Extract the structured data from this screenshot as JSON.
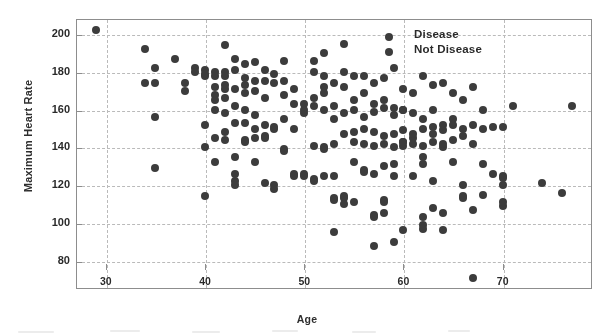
{
  "chart_data": {
    "type": "scatter",
    "title": "",
    "xlabel": "Age",
    "ylabel": "Maximum Heart Rate",
    "xlim": [
      27,
      79
    ],
    "ylim": [
      65,
      208
    ],
    "xticks": [
      30,
      40,
      50,
      60,
      70
    ],
    "yticks": [
      80,
      100,
      120,
      140,
      160,
      180,
      200
    ],
    "grid": true,
    "legend_position": "top-right",
    "marker_color": "#3d3d3d",
    "series": [
      {
        "name": "Disease",
        "color": "#3d3d3d",
        "points": [
          [
            29,
            202
          ],
          [
            34,
            192
          ],
          [
            35,
            182
          ],
          [
            34,
            174
          ],
          [
            35,
            174
          ],
          [
            37,
            187
          ],
          [
            38,
            174
          ],
          [
            38,
            170
          ],
          [
            39,
            182
          ],
          [
            39,
            180
          ],
          [
            40,
            181
          ],
          [
            40,
            179
          ],
          [
            40,
            178
          ],
          [
            41,
            180
          ],
          [
            41,
            178
          ],
          [
            41,
            172
          ],
          [
            41,
            168
          ],
          [
            41,
            165
          ],
          [
            42,
            194
          ],
          [
            42,
            180
          ],
          [
            42,
            178
          ],
          [
            42,
            173
          ],
          [
            42,
            171
          ],
          [
            42,
            166
          ],
          [
            43,
            187
          ],
          [
            43,
            181
          ],
          [
            43,
            171
          ],
          [
            43,
            162
          ],
          [
            44,
            184
          ],
          [
            44,
            177
          ],
          [
            44,
            173
          ],
          [
            44,
            169
          ],
          [
            44,
            153
          ],
          [
            45,
            185
          ],
          [
            45,
            175
          ],
          [
            45,
            170
          ],
          [
            46,
            181
          ],
          [
            46,
            175
          ],
          [
            46,
            166
          ],
          [
            47,
            179
          ],
          [
            47,
            174
          ],
          [
            48,
            186
          ],
          [
            48,
            175
          ],
          [
            48,
            168
          ],
          [
            49,
            171
          ],
          [
            49,
            163
          ],
          [
            50,
            163
          ],
          [
            50,
            158
          ],
          [
            51,
            186
          ],
          [
            51,
            180
          ],
          [
            51,
            166
          ],
          [
            52,
            190
          ],
          [
            52,
            178
          ],
          [
            52,
            172
          ],
          [
            52,
            169
          ],
          [
            53,
            174
          ],
          [
            53,
            162
          ],
          [
            54,
            195
          ],
          [
            54,
            180
          ],
          [
            54,
            172
          ],
          [
            55,
            178
          ],
          [
            55,
            165
          ],
          [
            56,
            178
          ],
          [
            56,
            169
          ],
          [
            57,
            174
          ],
          [
            57,
            163
          ],
          [
            58,
            177
          ],
          [
            58,
            165
          ],
          [
            59,
            182
          ],
          [
            59,
            161
          ],
          [
            60,
            171
          ],
          [
            60,
            160
          ],
          [
            61,
            169
          ],
          [
            62,
            178
          ],
          [
            63,
            173
          ],
          [
            64,
            174
          ],
          [
            65,
            169
          ],
          [
            66,
            165
          ],
          [
            67,
            172
          ],
          [
            68,
            160
          ],
          [
            71,
            162
          ],
          [
            77,
            162
          ],
          [
            35,
            156
          ],
          [
            40,
            152
          ],
          [
            41,
            160
          ],
          [
            42,
            158
          ],
          [
            43,
            153
          ],
          [
            44,
            160
          ],
          [
            45,
            157
          ],
          [
            46,
            152
          ],
          [
            47,
            150
          ],
          [
            48,
            155
          ],
          [
            49,
            150
          ],
          [
            50,
            160
          ],
          [
            51,
            162
          ],
          [
            52,
            160
          ],
          [
            53,
            155
          ],
          [
            54,
            158
          ],
          [
            55,
            160
          ],
          [
            56,
            156
          ],
          [
            57,
            159
          ],
          [
            58,
            161
          ],
          [
            59,
            157
          ],
          [
            60,
            160
          ],
          [
            61,
            158
          ],
          [
            62,
            155
          ],
          [
            63,
            160
          ],
          [
            64,
            152
          ],
          [
            65,
            155
          ],
          [
            66,
            150
          ],
          [
            67,
            152
          ],
          [
            68,
            150
          ],
          [
            69,
            151
          ],
          [
            70,
            151
          ]
        ]
      },
      {
        "name": "Not Disease",
        "color": "#3d3d3d",
        "points": [
          [
            35,
            129
          ],
          [
            40,
            114
          ],
          [
            40,
            140
          ],
          [
            41,
            145
          ],
          [
            41,
            132
          ],
          [
            42,
            148
          ],
          [
            42,
            144
          ],
          [
            43,
            135
          ],
          [
            43,
            126
          ],
          [
            43,
            122
          ],
          [
            43,
            120
          ],
          [
            44,
            144
          ],
          [
            44,
            143
          ],
          [
            45,
            150
          ],
          [
            45,
            145
          ],
          [
            45,
            132
          ],
          [
            46,
            146
          ],
          [
            46,
            145
          ],
          [
            46,
            121
          ],
          [
            47,
            120
          ],
          [
            47,
            118
          ],
          [
            47,
            151
          ],
          [
            48,
            139
          ],
          [
            48,
            138
          ],
          [
            49,
            126
          ],
          [
            49,
            125
          ],
          [
            50,
            126
          ],
          [
            50,
            125
          ],
          [
            51,
            123
          ],
          [
            51,
            122
          ],
          [
            52,
            125
          ],
          [
            52,
            140
          ],
          [
            53,
            142
          ],
          [
            53,
            125
          ],
          [
            53,
            113
          ],
          [
            53,
            112
          ],
          [
            54,
            114
          ],
          [
            54,
            113
          ],
          [
            54,
            110
          ],
          [
            53,
            95
          ],
          [
            54,
            147
          ],
          [
            55,
            132
          ],
          [
            55,
            111
          ],
          [
            56,
            128
          ],
          [
            56,
            127
          ],
          [
            57,
            126
          ],
          [
            57,
            104
          ],
          [
            57,
            103
          ],
          [
            57,
            88
          ],
          [
            58,
            130
          ],
          [
            58,
            112
          ],
          [
            58,
            111
          ],
          [
            58,
            105
          ],
          [
            59,
            125
          ],
          [
            59,
            90
          ],
          [
            59,
            131
          ],
          [
            60,
            96
          ],
          [
            60,
            143
          ],
          [
            60,
            141
          ],
          [
            61,
            125
          ],
          [
            61,
            145
          ],
          [
            62,
            99
          ],
          [
            62,
            97
          ],
          [
            62,
            103
          ],
          [
            62,
            131
          ],
          [
            62,
            135
          ],
          [
            63,
            147
          ],
          [
            63,
            122
          ],
          [
            63,
            108
          ],
          [
            64,
            96
          ],
          [
            64,
            105
          ],
          [
            64,
            140
          ],
          [
            65,
            144
          ],
          [
            65,
            132
          ],
          [
            66,
            120
          ],
          [
            66,
            114
          ],
          [
            66,
            113
          ],
          [
            67,
            71
          ],
          [
            67,
            107
          ],
          [
            67,
            142
          ],
          [
            68,
            131
          ],
          [
            68,
            115
          ],
          [
            69,
            126
          ],
          [
            70,
            125
          ],
          [
            70,
            124
          ],
          [
            70,
            109
          ],
          [
            70,
            111
          ],
          [
            70,
            120
          ],
          [
            74,
            121
          ],
          [
            76,
            116
          ],
          [
            51,
            141
          ],
          [
            52,
            139
          ],
          [
            55,
            143
          ],
          [
            56,
            142
          ],
          [
            57,
            141
          ],
          [
            58,
            142
          ],
          [
            59,
            140
          ],
          [
            60,
            143
          ],
          [
            61,
            142
          ],
          [
            62,
            141
          ],
          [
            63,
            143
          ],
          [
            64,
            142
          ],
          [
            55,
            148
          ],
          [
            56,
            150
          ],
          [
            57,
            148
          ],
          [
            58,
            146
          ],
          [
            59,
            147
          ],
          [
            60,
            149
          ],
          [
            61,
            147
          ],
          [
            62,
            150
          ],
          [
            63,
            151
          ],
          [
            64,
            149
          ],
          [
            65,
            152
          ],
          [
            66,
            146
          ]
        ]
      }
    ]
  },
  "legend": {
    "items": [
      {
        "label": "Disease"
      },
      {
        "label": "Not Disease"
      }
    ]
  }
}
